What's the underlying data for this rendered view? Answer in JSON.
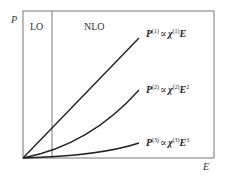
{
  "axes": {
    "y_label": "P",
    "x_label": "E"
  },
  "regions": {
    "left": "LO",
    "right": "NLO"
  },
  "curves": [
    {
      "P": "P",
      "order": "(1)",
      "prop": "∝",
      "chi": "χ",
      "chi_order": "(1)",
      "E": "E",
      "E_power": ""
    },
    {
      "P": "P",
      "order": "(2)",
      "prop": "∝",
      "chi": "χ",
      "chi_order": "(2)",
      "E": "E",
      "E_power": "2"
    },
    {
      "P": "P",
      "order": "(3)",
      "prop": "∝",
      "chi": "χ",
      "chi_order": "(3)",
      "E": "E",
      "E_power": "3"
    }
  ],
  "colors": {
    "frame": "#666666",
    "curve": "#222222"
  }
}
